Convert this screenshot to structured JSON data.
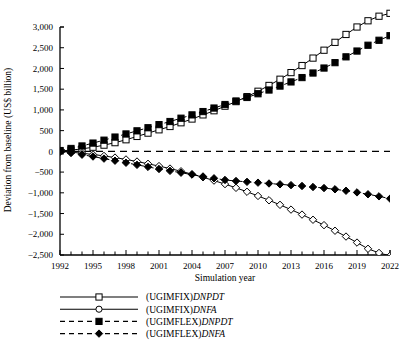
{
  "chart_data": {
    "type": "line",
    "title": "",
    "xlabel": "Simulation year",
    "ylabel": "Deviation from baseline (US$ billion)",
    "xlim": [
      1992,
      2022
    ],
    "ylim": [
      -2500,
      3000
    ],
    "xticks_major": [
      1992,
      1995,
      1998,
      2001,
      2004,
      2007,
      2010,
      2013,
      2016,
      2019,
      2022
    ],
    "xticks_minor_every": 1,
    "yticks": [
      -2500,
      -2000,
      -1500,
      -1000,
      -500,
      0,
      500,
      1000,
      1500,
      2000,
      2500,
      3000
    ],
    "ytick_labels": [
      "−2,500",
      "−2,000",
      "−1,500",
      "−1,000",
      "−500",
      "0",
      "500",
      "1,000",
      "1,500",
      "2,000",
      "2,500",
      "3,000"
    ],
    "grid": false,
    "zero_reference_line": {
      "value": 0,
      "style": "dashed"
    },
    "legend_position": "below",
    "x": [
      1992,
      1993,
      1994,
      1995,
      1996,
      1997,
      1998,
      1999,
      2000,
      2001,
      2002,
      2003,
      2004,
      2005,
      2006,
      2007,
      2008,
      2009,
      2010,
      2011,
      2012,
      2013,
      2014,
      2015,
      2016,
      2017,
      2018,
      2019,
      2020,
      2021,
      2022
    ],
    "series": [
      {
        "name": "(UGIMFIX)DNPDT",
        "name_prefix": "(UGIMFIX)",
        "name_suffix": "DNPDT",
        "marker": "open-square",
        "line": "solid",
        "color": "#000000",
        "values": [
          10,
          30,
          60,
          100,
          150,
          210,
          280,
          360,
          440,
          520,
          600,
          690,
          780,
          880,
          980,
          1090,
          1200,
          1320,
          1450,
          1590,
          1740,
          1900,
          2070,
          2250,
          2440,
          2630,
          2820,
          3000,
          3150,
          3260,
          3330
        ]
      },
      {
        "name": "(UGIMFIX)DNFA",
        "name_prefix": "(UGIMFIX)",
        "name_suffix": "DNFA",
        "marker": "open-diamond",
        "line": "solid",
        "color": "#000000",
        "values": [
          -5,
          -20,
          -45,
          -75,
          -110,
          -150,
          -195,
          -245,
          -300,
          -355,
          -415,
          -480,
          -550,
          -625,
          -705,
          -790,
          -880,
          -975,
          -1075,
          -1180,
          -1290,
          -1405,
          -1525,
          -1650,
          -1780,
          -1915,
          -2055,
          -2200,
          -2350,
          -2450,
          -2520
        ]
      },
      {
        "name": "(UGIMFLEX)DNPDT",
        "name_prefix": "(UGIMFLEX)",
        "name_suffix": "DNPDT",
        "marker": "filled-square",
        "line": "dashed",
        "color": "#000000",
        "values": [
          20,
          70,
          130,
          200,
          270,
          345,
          420,
          495,
          570,
          645,
          720,
          800,
          880,
          960,
          1045,
          1130,
          1215,
          1300,
          1390,
          1480,
          1575,
          1675,
          1780,
          1890,
          2010,
          2140,
          2280,
          2420,
          2560,
          2680,
          2790
        ]
      },
      {
        "name": "(UGIMFLEX)DNFA",
        "name_prefix": "(UGIMFLEX)",
        "name_suffix": "DNFA",
        "marker": "filled-diamond",
        "line": "dashed",
        "color": "#000000",
        "values": [
          -10,
          -40,
          -80,
          -125,
          -175,
          -225,
          -275,
          -325,
          -375,
          -425,
          -470,
          -515,
          -560,
          -605,
          -650,
          -690,
          -715,
          -735,
          -755,
          -775,
          -795,
          -815,
          -835,
          -860,
          -885,
          -915,
          -950,
          -990,
          -1035,
          -1085,
          -1140
        ]
      }
    ]
  },
  "legend": {
    "items": [
      {
        "prefix": "(UGIMFIX)",
        "suffix": "DNPDT",
        "marker": "open-square",
        "line": "solid"
      },
      {
        "prefix": "(UGIMFIX)",
        "suffix": "DNFA",
        "marker": "open-circle",
        "line": "solid"
      },
      {
        "prefix": "(UGIMFLEX)",
        "suffix": "DNPDT",
        "marker": "filled-square",
        "line": "dashed"
      },
      {
        "prefix": "(UGIMFLEX)",
        "suffix": "DNFA",
        "marker": "filled-diamond",
        "line": "dashed"
      }
    ]
  },
  "axes": {
    "x_title": "Simulation year",
    "y_title": "Deviation from baseline (US$ billion)"
  }
}
